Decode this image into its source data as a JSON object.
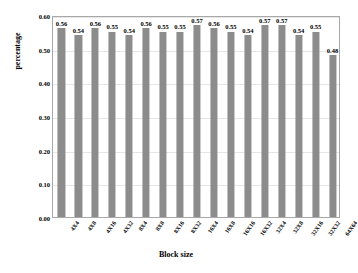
{
  "chart_data": {
    "type": "bar",
    "title": "",
    "subtitle": "",
    "xlabel": "Block size",
    "ylabel": "percentage",
    "categories": [
      "4X4",
      "4X8",
      "4X16",
      "4X32",
      "8X4",
      "8X8",
      "8X16",
      "8X32",
      "16X4",
      "16X8",
      "16X16",
      "16X32",
      "32X4",
      "32X8",
      "32X16",
      "32X32",
      "64X64"
    ],
    "values": [
      0.56,
      0.54,
      0.56,
      0.55,
      0.54,
      0.56,
      0.55,
      0.55,
      0.57,
      0.56,
      0.55,
      0.54,
      0.57,
      0.57,
      0.54,
      0.55,
      0.48
    ],
    "data_labels": [
      "0.56",
      "0.54",
      "0.56",
      "0.55",
      "0.54",
      "0.56",
      "0.55",
      "0.55",
      "0.57",
      "0.56",
      "0.55",
      "0.54",
      "0.57",
      "0.57",
      "0.54",
      "0.55",
      "0.48"
    ],
    "ylim": [
      0.0,
      0.6
    ],
    "ytick_values": [
      0.0,
      0.1,
      0.2,
      0.3,
      0.4,
      0.5,
      0.6
    ],
    "ytick_labels": [
      "0.00",
      "0.10",
      "0.20",
      "0.30",
      "0.40",
      "0.50",
      "0.60"
    ],
    "grid": true,
    "legend": false,
    "legend_position": "none",
    "bar_color": "#8c8c8c",
    "grid_color": "#e6e6e6",
    "frame_color": "#a8a8a8",
    "background_color": "#ffffff",
    "text_color": "#000000"
  }
}
